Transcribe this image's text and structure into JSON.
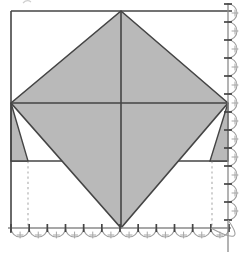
{
  "figure": {
    "kind": "geometric-diagram",
    "canvas": {
      "width": 243,
      "height": 257,
      "background": "#ffffff"
    },
    "colors": {
      "shade": "#b9b9b9",
      "line_dark": "#454545",
      "edge_baseline": "#8a8a8a",
      "scallop": "#9e9e9e",
      "plus": "#a6a6a6",
      "dash": "#b8b8b8",
      "artifact": "#cfcfcf"
    },
    "stroke_widths": {
      "main": 1.6,
      "fold": 1.4,
      "dash": 1.3,
      "baseline": 1.3,
      "arc": 1.05,
      "tick": 1.7,
      "plus": 1.0
    },
    "square": {
      "left": 11,
      "top": 11,
      "right": 228,
      "bottom": 228,
      "left_edge_bottom_overhang": 233,
      "top_edge_right_overhang": 232
    },
    "diamond": {
      "points": "121,11 228,103 121,228 11,103"
    },
    "diagonal_vertical": {
      "x": 121,
      "y1": 11,
      "y2": 228
    },
    "diagonal_horizontal": {
      "y": 103,
      "x1": 11,
      "x2": 228
    },
    "fold_line": {
      "y": 161,
      "x1": 11,
      "x2": 228
    },
    "flap_left": {
      "points": "11,103 28,161 11,161"
    },
    "flap_right": {
      "points": "228,103 210,161 228,161"
    },
    "dashed_guides": [
      {
        "x": 28,
        "y1": 161,
        "y2": 228
      },
      {
        "x": 212,
        "y1": 161,
        "y2": 228
      }
    ],
    "bottom_edge": {
      "y": 228,
      "line_x1": 8,
      "line_x2": 231,
      "tick_from": 11,
      "tick_to": 229,
      "tick_count": 13,
      "tick_half": 4,
      "plus_offset": 7,
      "plus_half": 3.4
    },
    "right_edge": {
      "x": 228,
      "line_y1": 3,
      "line_y2": 252,
      "tick_from": 4,
      "tick_to": 220,
      "tick_count": 13,
      "tick_half": 4,
      "plus_offset": 7,
      "plus_half": 3.4
    },
    "corner_arc": {
      "d": "M 210.8 228 Q 248 248 228 220"
    },
    "artifact": {
      "d": "M 23 3 Q 27 -1 31 2"
    }
  }
}
